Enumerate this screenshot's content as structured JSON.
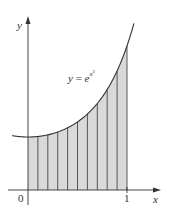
{
  "figure": {
    "axis_labels": {
      "x": "x",
      "y": "y"
    },
    "tick_labels": {
      "origin": "0",
      "x_one": "1"
    },
    "curve_label": {
      "lhs": "y",
      "eq": " = ",
      "base": "e",
      "exponent_base": "x",
      "exponent_power": "2"
    },
    "colors": {
      "fill": "#d9d9d9",
      "stroke": "#333333",
      "background": "#ffffff"
    }
  },
  "chart_data": {
    "type": "area",
    "title": "",
    "function": "y = e^(x^2)",
    "xlabel": "x",
    "ylabel": "y",
    "xlim": [
      -0.16,
      1.3
    ],
    "ylim": [
      0,
      3.2
    ],
    "shaded_interval": [
      0,
      1
    ],
    "num_strips": 10,
    "strip_edges": [
      0,
      0.1,
      0.2,
      0.3,
      0.4,
      0.5,
      0.6,
      0.7,
      0.8,
      0.9,
      1.0
    ],
    "x_ticks": [
      0,
      1
    ],
    "x_tick_labels": [
      "0",
      "1"
    ],
    "annotations": [
      "y = e^{x^2}"
    ],
    "grid": false,
    "legend": null
  }
}
